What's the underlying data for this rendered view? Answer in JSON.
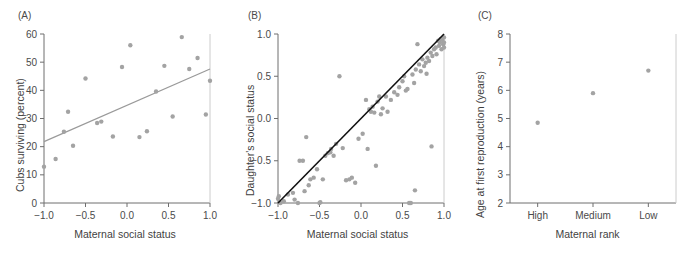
{
  "figure": {
    "background": "#ffffff",
    "point_color": "#a3a3a3",
    "axis_color": "#6e6e6e",
    "fit_line_color": "#9a9a9a",
    "identity_line_color": "#111111"
  },
  "panels": [
    {
      "id": "A",
      "label": "(A)",
      "xlabel": "Maternal social status",
      "ylabel": "Cubs surviving (percent)"
    },
    {
      "id": "B",
      "label": "(B)",
      "xlabel": "Maternal social status",
      "ylabel": "Daughter's social status"
    },
    {
      "id": "C",
      "label": "(C)",
      "xlabel": "Maternal rank",
      "ylabel": "Age at first reproduction (years)"
    }
  ],
  "chart_data": [
    {
      "type": "scatter",
      "panel": "A",
      "title": "(A)",
      "xlabel": "Maternal social status",
      "ylabel": "Cubs surviving (percent)",
      "xlim": [
        -1.0,
        1.0
      ],
      "ylim": [
        0,
        60
      ],
      "xticks": [
        -1.0,
        -0.5,
        0.0,
        0.5,
        1.0
      ],
      "xticklabels": [
        "−1.0",
        "−0.5",
        "0.0",
        "0.5",
        "1.0"
      ],
      "yticks": [
        0,
        10,
        20,
        30,
        40,
        50,
        60
      ],
      "yticklabels": [
        "0",
        "10",
        "20",
        "30",
        "40",
        "50",
        "60"
      ],
      "grid": false,
      "legend": false,
      "points": [
        [
          -1.0,
          12.9
        ],
        [
          -0.86,
          15.6
        ],
        [
          -0.76,
          25.3
        ],
        [
          -0.71,
          32.4
        ],
        [
          -0.65,
          20.3
        ],
        [
          -0.5,
          44.2
        ],
        [
          -0.36,
          28.4
        ],
        [
          -0.31,
          28.9
        ],
        [
          -0.17,
          23.6
        ],
        [
          -0.06,
          48.3
        ],
        [
          0.04,
          56.0
        ],
        [
          0.15,
          23.4
        ],
        [
          0.24,
          25.5
        ],
        [
          0.35,
          39.6
        ],
        [
          0.45,
          48.7
        ],
        [
          0.55,
          30.7
        ],
        [
          0.66,
          58.9
        ],
        [
          0.75,
          47.6
        ],
        [
          0.85,
          51.5
        ],
        [
          0.95,
          31.4
        ],
        [
          1.0,
          43.4
        ]
      ],
      "fit_line": {
        "type": "linear",
        "x": [
          -1.0,
          1.0
        ],
        "y": [
          21.8,
          47.6
        ]
      }
    },
    {
      "type": "scatter",
      "panel": "B",
      "title": "(B)",
      "xlabel": "Maternal social status",
      "ylabel": "Daughter's social status",
      "xlim": [
        -1.0,
        1.0
      ],
      "ylim": [
        -1.0,
        1.0
      ],
      "xticks": [
        -1.0,
        -0.5,
        0.0,
        0.5,
        1.0
      ],
      "xticklabels": [
        "−1.0",
        "−0.5",
        "0.0",
        "0.5",
        "1.0"
      ],
      "yticks": [
        -1.0,
        -0.5,
        0.0,
        0.5,
        1.0
      ],
      "yticklabels": [
        "−1.0",
        "−0.5",
        "0.0",
        "0.5",
        "1.0"
      ],
      "grid": false,
      "legend": false,
      "points": [
        [
          -1.0,
          -0.95
        ],
        [
          -0.99,
          -0.92
        ],
        [
          -0.97,
          -1.0
        ],
        [
          -0.93,
          -0.98
        ],
        [
          -0.88,
          -0.9
        ],
        [
          -0.82,
          -0.88
        ],
        [
          -0.8,
          -0.96
        ],
        [
          -0.76,
          -1.0
        ],
        [
          -0.74,
          -0.5
        ],
        [
          -0.7,
          -0.5
        ],
        [
          -0.68,
          -0.86
        ],
        [
          -0.66,
          -0.22
        ],
        [
          -0.63,
          -0.79
        ],
        [
          -0.61,
          -0.72
        ],
        [
          -0.57,
          -0.7
        ],
        [
          -0.53,
          -0.6
        ],
        [
          -0.5,
          -1.0
        ],
        [
          -0.49,
          -0.99
        ],
        [
          -0.46,
          -0.72
        ],
        [
          -0.43,
          -0.44
        ],
        [
          -0.4,
          -0.41
        ],
        [
          -0.37,
          -0.4
        ],
        [
          -0.36,
          -0.36
        ],
        [
          -0.33,
          -0.44
        ],
        [
          -0.3,
          -0.3
        ],
        [
          -0.26,
          0.5
        ],
        [
          -0.22,
          -0.35
        ],
        [
          -0.18,
          -0.73
        ],
        [
          -0.14,
          -0.72
        ],
        [
          -0.11,
          -0.7
        ],
        [
          -0.07,
          -0.76
        ],
        [
          -0.03,
          -0.24
        ],
        [
          0.02,
          -0.18
        ],
        [
          0.06,
          0.22
        ],
        [
          0.08,
          -0.36
        ],
        [
          0.1,
          0.11
        ],
        [
          0.12,
          0.08
        ],
        [
          0.14,
          0.14
        ],
        [
          0.16,
          0.07
        ],
        [
          0.18,
          -0.56
        ],
        [
          0.2,
          0.2
        ],
        [
          0.22,
          0.26
        ],
        [
          0.24,
          0.05
        ],
        [
          0.26,
          0.12
        ],
        [
          0.3,
          0.26
        ],
        [
          0.32,
          0.08
        ],
        [
          0.36,
          0.22
        ],
        [
          0.4,
          0.31
        ],
        [
          0.44,
          0.28
        ],
        [
          0.46,
          0.37
        ],
        [
          0.5,
          0.44
        ],
        [
          0.52,
          0.5
        ],
        [
          0.54,
          0.33
        ],
        [
          0.56,
          0.35
        ],
        [
          0.58,
          -1.0
        ],
        [
          0.6,
          -1.0
        ],
        [
          0.62,
          0.52
        ],
        [
          0.64,
          0.42
        ],
        [
          0.65,
          -0.85
        ],
        [
          0.66,
          0.58
        ],
        [
          0.68,
          0.88
        ],
        [
          0.7,
          0.64
        ],
        [
          0.72,
          0.56
        ],
        [
          0.74,
          0.7
        ],
        [
          0.76,
          0.62
        ],
        [
          0.78,
          0.66
        ],
        [
          0.79,
          0.53
        ],
        [
          0.8,
          0.72
        ],
        [
          0.82,
          0.68
        ],
        [
          0.84,
          0.78
        ],
        [
          0.85,
          -0.33
        ],
        [
          0.86,
          0.74
        ],
        [
          0.88,
          0.82
        ],
        [
          0.9,
          0.84
        ],
        [
          0.91,
          0.76
        ],
        [
          0.93,
          0.92
        ],
        [
          0.94,
          0.86
        ],
        [
          0.95,
          0.9
        ],
        [
          0.96,
          0.94
        ],
        [
          0.97,
          0.82
        ],
        [
          0.98,
          0.93
        ],
        [
          0.99,
          0.88
        ],
        [
          1.0,
          0.96
        ],
        [
          1.0,
          0.9
        ],
        [
          1.0,
          0.84
        ]
      ],
      "identity_line": {
        "type": "linear",
        "x": [
          -1.0,
          1.0
        ],
        "y": [
          -1.0,
          1.0
        ]
      }
    },
    {
      "type": "scatter",
      "panel": "C",
      "title": "(C)",
      "xlabel": "Maternal rank",
      "ylabel": "Age at first reproduction (years)",
      "categories": [
        "High",
        "Medium",
        "Low"
      ],
      "values": [
        4.85,
        5.9,
        6.7
      ],
      "ylim": [
        2,
        8
      ],
      "yticks": [
        2,
        3,
        4,
        5,
        6,
        7,
        8
      ],
      "yticklabels": [
        "2",
        "3",
        "4",
        "5",
        "6",
        "7",
        "8"
      ],
      "grid": false,
      "legend": false
    }
  ]
}
